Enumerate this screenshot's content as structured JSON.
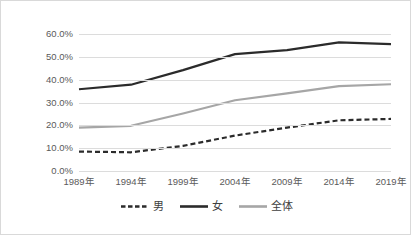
{
  "chart_data": {
    "type": "line",
    "title": "",
    "subtitle": "",
    "xlabel": "",
    "ylabel": "",
    "categories": [
      "1989年",
      "1994年",
      "1999年",
      "2004年",
      "2009年",
      "2014年",
      "2019年"
    ],
    "series": [
      {
        "name": "男",
        "values": [
          8.5,
          8.2,
          11.0,
          15.5,
          19.0,
          22.2,
          22.8
        ],
        "color": "#2b2b2b",
        "style": "dashed"
      },
      {
        "name": "女",
        "values": [
          35.8,
          37.8,
          44.2,
          51.2,
          52.9,
          56.3,
          55.6
        ],
        "color": "#2b2b2b",
        "style": "solid"
      },
      {
        "name": "全体",
        "values": [
          19.0,
          19.8,
          25.2,
          31.0,
          34.0,
          37.2,
          38.0
        ],
        "color": "#a6a6a6",
        "style": "solid"
      }
    ],
    "ylim": [
      0,
      60
    ],
    "ytick_values": [
      0,
      10,
      20,
      30,
      40,
      50,
      60
    ],
    "ytick_labels": [
      "0.0%",
      "10.0%",
      "20.0%",
      "30.0%",
      "40.0%",
      "50.0%",
      "60.0%"
    ],
    "grid": true,
    "legend_position": "bottom",
    "gridline_color": "#dcdcdc",
    "axis_text_color": "#5a5a5a",
    "border_color": "#d9d9d9",
    "background_color": "#ffffff"
  }
}
